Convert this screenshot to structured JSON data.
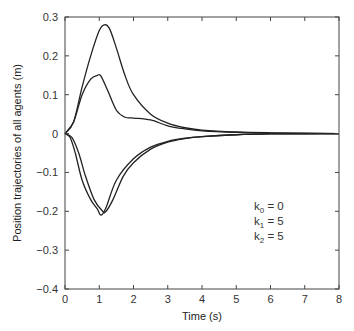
{
  "chart_data": {
    "type": "line",
    "title": "",
    "xlabel": "Time (s)",
    "ylabel": "Position trajectories of all agents (m)",
    "xlim": [
      0,
      8
    ],
    "ylim": [
      -0.4,
      0.3
    ],
    "grid": false,
    "legend": null,
    "x_ticks": [
      0,
      1,
      2,
      3,
      4,
      5,
      6,
      7,
      8
    ],
    "x_tick_labels": [
      "0",
      "1",
      "2",
      "3",
      "4",
      "5",
      "6",
      "7",
      "8"
    ],
    "y_ticks": [
      0.3,
      0.2,
      0.1,
      0,
      -0.1,
      -0.2,
      -0.3,
      -0.4
    ],
    "y_tick_labels": [
      "0.3",
      "0.2",
      "0.1",
      "0",
      "−0.1",
      "−0.2",
      "−0.3",
      "−0.4"
    ],
    "annotations": [
      {
        "base": "k",
        "sub": "0",
        "text": " = 0"
      },
      {
        "base": "k",
        "sub": "1",
        "text": " = 5"
      },
      {
        "base": "k",
        "sub": "2",
        "text": " = 5"
      }
    ],
    "series": [
      {
        "name": "agent-1",
        "x": [
          0,
          0.25,
          0.5,
          0.75,
          1.0,
          1.15,
          1.3,
          1.5,
          1.75,
          2.0,
          2.5,
          3.0,
          3.5,
          4.0,
          5.0,
          6.0,
          8.0
        ],
        "y": [
          0,
          0.03,
          0.12,
          0.2,
          0.265,
          0.28,
          0.27,
          0.22,
          0.15,
          0.1,
          0.05,
          0.027,
          0.015,
          0.009,
          0.004,
          0.002,
          0
        ]
      },
      {
        "name": "agent-2",
        "x": [
          0,
          0.25,
          0.5,
          0.75,
          0.95,
          1.05,
          1.25,
          1.5,
          1.75,
          2.0,
          2.5,
          3.0,
          3.5,
          4.0,
          5.0,
          6.0,
          8.0
        ],
        "y": [
          0,
          0.03,
          0.1,
          0.14,
          0.15,
          0.148,
          0.11,
          0.06,
          0.042,
          0.04,
          0.035,
          0.02,
          0.012,
          0.007,
          0.003,
          0.001,
          0
        ]
      },
      {
        "name": "agent-3",
        "x": [
          0,
          0.15,
          0.3,
          0.5,
          0.75,
          0.95,
          1.05,
          1.2,
          1.5,
          2.0,
          2.5,
          3.0,
          3.5,
          4.0,
          5.0,
          6.0,
          8.0
        ],
        "y": [
          0,
          -0.01,
          -0.05,
          -0.12,
          -0.17,
          -0.195,
          -0.21,
          -0.19,
          -0.12,
          -0.065,
          -0.035,
          -0.02,
          -0.012,
          -0.008,
          -0.003,
          -0.001,
          0
        ]
      },
      {
        "name": "agent-4",
        "x": [
          0,
          0.2,
          0.4,
          0.6,
          0.85,
          1.1,
          1.2,
          1.4,
          1.7,
          2.0,
          2.5,
          3.0,
          3.5,
          4.0,
          5.0,
          6.0,
          8.0
        ],
        "y": [
          0,
          -0.01,
          -0.05,
          -0.11,
          -0.17,
          -0.2,
          -0.2,
          -0.17,
          -0.11,
          -0.075,
          -0.04,
          -0.022,
          -0.013,
          -0.008,
          -0.003,
          -0.001,
          0
        ]
      }
    ],
    "colors": {
      "line": "#222222",
      "axis": "#444444",
      "text": "#333333"
    }
  },
  "layout": {
    "plot": {
      "left": 65,
      "right": 339,
      "top": 17,
      "bottom": 289
    }
  }
}
